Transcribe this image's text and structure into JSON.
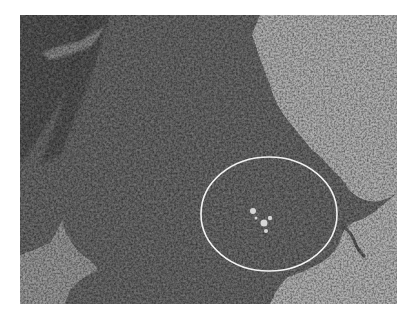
{
  "image": {
    "description": "Grayscale histology micrograph of densely cellular tissue with a white elliptical annotation",
    "colors": {
      "background": "#ffffff",
      "tissue": "#5e5e5e",
      "tissue_dark": "#464646",
      "empty_space": "#a9a9a9",
      "annotation": "#f2f2f2"
    },
    "annotation": {
      "shape": "ellipse",
      "center_x": 269,
      "center_y": 214,
      "radius_x": 68,
      "radius_y": 57
    }
  }
}
